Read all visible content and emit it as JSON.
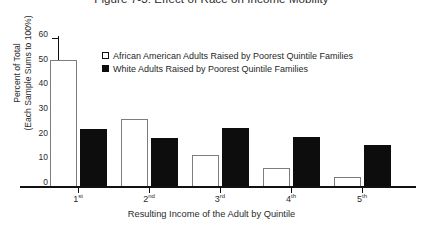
{
  "chart_data": {
    "type": "bar",
    "title": "Figure 7-3:  Effect of Race on Income Mobility",
    "xlabel": "Resulting Income of the Adult by Quintile",
    "ylabel_line1": "Percent of Total",
    "ylabel_line2": "(Each Sample Sums to 100%)",
    "categories": [
      "1",
      "2",
      "3",
      "4",
      "5"
    ],
    "category_suffixes": [
      "st",
      "nd",
      "rd",
      "th",
      "th"
    ],
    "series": [
      {
        "name": "African American Adults Raised by Poorest Quintile Families",
        "style": "open",
        "color": "#ffffff",
        "border_color": "#7d7d7d",
        "values": [
          51,
          27,
          12.5,
          7.5,
          3.5
        ]
      },
      {
        "name": "White Adults Raised by Poorest Quintile Families",
        "style": "filled",
        "color": "#0d0d0d",
        "border_color": "#0d0d0d",
        "values": [
          23,
          19.5,
          23.5,
          19.8,
          16.5
        ]
      }
    ],
    "ylim": [
      0,
      60
    ],
    "yticks": [
      0,
      10,
      20,
      30,
      40,
      50,
      60
    ],
    "ytick_labels": [
      "0",
      "10",
      "20",
      "30",
      "40",
      "50",
      "60"
    ],
    "grid": false,
    "legend_position": "upper-center-inside"
  }
}
